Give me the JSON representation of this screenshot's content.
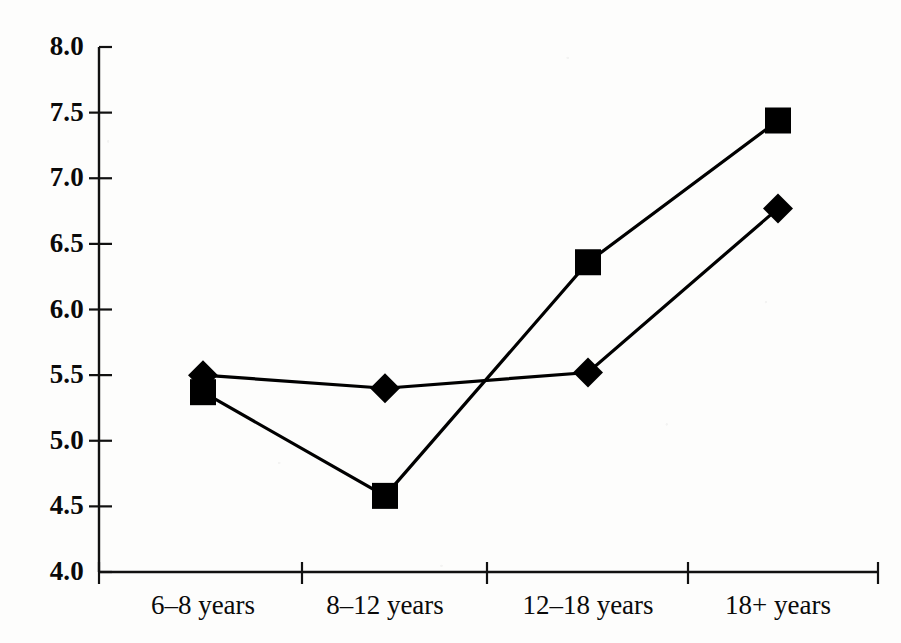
{
  "chart_data": {
    "type": "line",
    "title": "",
    "subtitle": "",
    "xlabel": "",
    "ylabel": "",
    "categories": [
      "6–8 years",
      "8–12 years",
      "12–18 years",
      "18+ years"
    ],
    "series": [
      {
        "name": "series-diamond",
        "marker": "diamond",
        "color": "#000000",
        "values": [
          5.5,
          5.4,
          5.52,
          6.77
        ]
      },
      {
        "name": "series-square",
        "marker": "square",
        "color": "#000000",
        "values": [
          5.37,
          4.58,
          6.36,
          7.44
        ]
      }
    ],
    "ylim": [
      4.0,
      8.0
    ],
    "ytick_values": [
      4.0,
      4.5,
      5.0,
      5.5,
      6.0,
      6.5,
      7.0,
      7.5,
      8.0
    ],
    "ytick_labels": [
      "4.0",
      "4.5",
      "5.0",
      "5.5",
      "6.0",
      "6.5",
      "7.0",
      "7.5",
      "8.0"
    ],
    "grid": false,
    "legend": "none",
    "line_color": "#000000",
    "axis_color": "#111111",
    "background_color": "#fdfdfc"
  },
  "axes": {
    "y_axis_name": "y-axis",
    "x_axis_name": "x-axis"
  }
}
